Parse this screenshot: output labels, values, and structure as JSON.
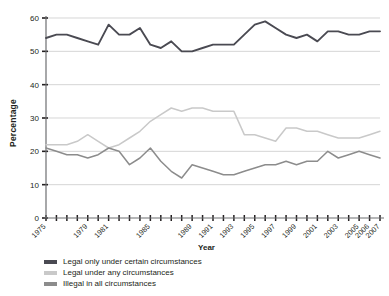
{
  "chart_data": {
    "type": "line",
    "title": "",
    "xlabel": "Year",
    "ylabel": "Percentage",
    "ylim": [
      0,
      60
    ],
    "ytick_labels": [
      "0",
      "10",
      "20",
      "30",
      "40",
      "50",
      "60"
    ],
    "ytick_values": [
      0,
      10,
      20,
      30,
      40,
      50,
      60
    ],
    "grid": "horizontal",
    "legend_position": "below-left",
    "x": [
      1975,
      1976,
      1977,
      1978,
      1979,
      1980,
      1981,
      1982,
      1983,
      1984,
      1985,
      1986,
      1987,
      1988,
      1989,
      1990,
      1991,
      1992,
      1993,
      1994,
      1995,
      1996,
      1997,
      1998,
      1999,
      2000,
      2001,
      2002,
      2003,
      2004,
      2005,
      2006,
      2007
    ],
    "xtick_labels": [
      "1975",
      "1979",
      "1981",
      "1985",
      "1989",
      "1991",
      "1993",
      "1995",
      "1997",
      "1999",
      "2001",
      "2003",
      "2005",
      "2006",
      "2007"
    ],
    "xtick_label_values": [
      1975,
      1979,
      1981,
      1985,
      1989,
      1991,
      1993,
      1995,
      1997,
      1999,
      2001,
      2003,
      2005,
      2006,
      2007
    ],
    "series": [
      {
        "name": "Legal only under certain circumstances",
        "color": "#4a4a52",
        "values": [
          54,
          55,
          55,
          54,
          53,
          52,
          58,
          55,
          55,
          57,
          52,
          51,
          53,
          50,
          50,
          51,
          52,
          52,
          52,
          55,
          58,
          59,
          57,
          55,
          54,
          55,
          53,
          56,
          56,
          55,
          55,
          56,
          56
        ]
      },
      {
        "name": "Legal under any circumstances",
        "color": "#c9c9c9",
        "values": [
          22,
          22,
          22,
          23,
          25,
          23,
          21,
          22,
          24,
          26,
          29,
          31,
          33,
          32,
          33,
          33,
          32,
          32,
          32,
          25,
          25,
          24,
          23,
          27,
          27,
          26,
          26,
          25,
          24,
          24,
          24,
          25,
          26
        ]
      },
      {
        "name": "Illegal in all circumstances",
        "color": "#8c8c8c",
        "values": [
          21,
          20,
          19,
          19,
          18,
          19,
          21,
          20,
          16,
          18,
          21,
          17,
          14,
          12,
          16,
          15,
          14,
          13,
          13,
          14,
          15,
          16,
          16,
          17,
          16,
          17,
          17,
          20,
          18,
          19,
          20,
          19,
          18
        ]
      }
    ]
  },
  "legend": {
    "items": [
      {
        "label": "Legal only under certain circumstances",
        "color": "#4a4a52"
      },
      {
        "label": "Legal under any circumstances",
        "color": "#c9c9c9"
      },
      {
        "label": "Illegal in all circumstances",
        "color": "#8c8c8c"
      }
    ]
  },
  "axes": {
    "y_title": "Percentage",
    "x_title": "Year"
  },
  "colors": {
    "text": "#231f20",
    "axis": "#6d6e71",
    "grid": "#c4c4c4",
    "background": "#ffffff"
  }
}
